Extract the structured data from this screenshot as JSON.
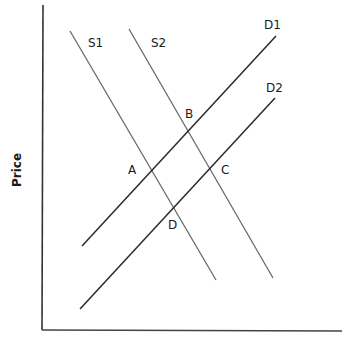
{
  "diagram": {
    "type": "supply-demand",
    "axes": {
      "y_label": "Price",
      "x_label": ""
    },
    "curves": [
      {
        "id": "S1",
        "label": "S1",
        "kind": "supply",
        "color": "#6a6a6a"
      },
      {
        "id": "S2",
        "label": "S2",
        "kind": "supply",
        "color": "#6a6a6a"
      },
      {
        "id": "D1",
        "label": "D1",
        "kind": "demand",
        "color": "#2a2a2a"
      },
      {
        "id": "D2",
        "label": "D2",
        "kind": "demand",
        "color": "#2a2a2a"
      }
    ],
    "points": [
      {
        "label": "A",
        "intersection": [
          "S1",
          "D1"
        ]
      },
      {
        "label": "B",
        "intersection": [
          "S2",
          "D1"
        ]
      },
      {
        "label": "C",
        "intersection": [
          "S2",
          "D2"
        ]
      },
      {
        "label": "D",
        "intersection": [
          "S1",
          "D2"
        ]
      }
    ],
    "colors": {
      "axis": "#333333",
      "supply": "#6a6a6a",
      "demand": "#2a2a2a",
      "text": "#1a1a1a"
    }
  },
  "labels": {
    "y_axis": "Price",
    "s1": "S1",
    "s2": "S2",
    "d1": "D1",
    "d2": "D2",
    "a": "A",
    "b": "B",
    "c": "C",
    "d": "D"
  }
}
